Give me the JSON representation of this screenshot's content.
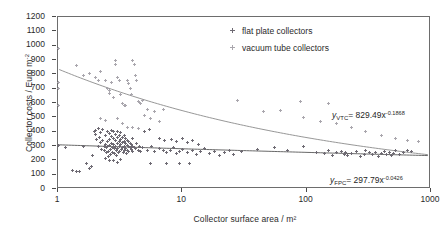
{
  "chart_data": {
    "type": "scatter",
    "title": "",
    "xlabel": "Collector surface area / m²",
    "ylabel": "Collector costs / Euro m",
    "ylabel_sup": "-2",
    "xscale": "log",
    "yscale": "linear",
    "xlim": [
      1,
      1000
    ],
    "ylim": [
      0,
      1200
    ],
    "xticks": [
      1,
      10,
      100,
      1000
    ],
    "xtick_labels": [
      "1",
      "10",
      "100",
      "1000"
    ],
    "yticks": [
      0,
      100,
      200,
      300,
      400,
      500,
      600,
      700,
      800,
      900,
      1000,
      1100,
      1200
    ],
    "ytick_labels": [
      "0",
      "100",
      "200",
      "300",
      "400",
      "500",
      "600",
      "700",
      "800",
      "900",
      "1000",
      "1100",
      "1200"
    ],
    "grid": false,
    "legend_position": "top-right",
    "colors": {
      "flat_plate": "#6e6a73",
      "vacuum_tube": "#a9a6ad",
      "trend_line": "#8a8a8a",
      "axis": "#6d6d6d",
      "text": "#2a2a2a"
    },
    "series": [
      {
        "name": "flat plate collectors",
        "marker": "plus",
        "color": "#6e6a73",
        "points": [
          [
            1.0,
            302
          ],
          [
            1.15,
            288
          ],
          [
            1.3,
            132
          ],
          [
            1.4,
            120
          ],
          [
            1.5,
            125
          ],
          [
            1.6,
            300
          ],
          [
            1.7,
            175
          ],
          [
            1.8,
            143
          ],
          [
            1.85,
            160
          ],
          [
            1.9,
            232
          ],
          [
            1.95,
            398
          ],
          [
            2.0,
            410
          ],
          [
            2.0,
            380
          ],
          [
            2.05,
            345
          ],
          [
            2.1,
            420
          ],
          [
            2.1,
            300
          ],
          [
            2.15,
            358
          ],
          [
            2.2,
            392
          ],
          [
            2.2,
            322
          ],
          [
            2.25,
            276
          ],
          [
            2.3,
            418
          ],
          [
            2.3,
            340
          ],
          [
            2.35,
            300
          ],
          [
            2.35,
            268
          ],
          [
            2.4,
            372
          ],
          [
            2.4,
            312
          ],
          [
            2.45,
            288
          ],
          [
            2.45,
            255
          ],
          [
            2.5,
            400
          ],
          [
            2.5,
            330
          ],
          [
            2.5,
            298
          ],
          [
            2.55,
            262
          ],
          [
            2.55,
            228
          ],
          [
            2.6,
            386
          ],
          [
            2.6,
            348
          ],
          [
            2.6,
            305
          ],
          [
            2.65,
            275
          ],
          [
            2.65,
            243
          ],
          [
            2.7,
            410
          ],
          [
            2.7,
            365
          ],
          [
            2.7,
            318
          ],
          [
            2.75,
            292
          ],
          [
            2.75,
            258
          ],
          [
            2.8,
            398
          ],
          [
            2.8,
            352
          ],
          [
            2.8,
            310
          ],
          [
            2.85,
            280
          ],
          [
            2.85,
            248
          ],
          [
            2.9,
            380
          ],
          [
            2.9,
            335
          ],
          [
            2.9,
            300
          ],
          [
            2.95,
            270
          ],
          [
            2.95,
            236
          ],
          [
            3.0,
            402
          ],
          [
            3.0,
            356
          ],
          [
            3.0,
            315
          ],
          [
            3.0,
            285
          ],
          [
            3.05,
            252
          ],
          [
            3.1,
            372
          ],
          [
            3.1,
            328
          ],
          [
            3.1,
            296
          ],
          [
            3.15,
            264
          ],
          [
            3.2,
            392
          ],
          [
            3.2,
            344
          ],
          [
            3.2,
            308
          ],
          [
            3.25,
            276
          ],
          [
            3.3,
            360
          ],
          [
            3.3,
            322
          ],
          [
            3.3,
            290
          ],
          [
            3.35,
            258
          ],
          [
            3.4,
            376
          ],
          [
            3.4,
            334
          ],
          [
            3.4,
            300
          ],
          [
            3.45,
            268
          ],
          [
            3.5,
            352
          ],
          [
            3.5,
            314
          ],
          [
            3.5,
            282
          ],
          [
            3.55,
            245
          ],
          [
            3.6,
            340
          ],
          [
            3.6,
            305
          ],
          [
            3.6,
            272
          ],
          [
            3.7,
            330
          ],
          [
            3.7,
            296
          ],
          [
            3.7,
            262
          ],
          [
            3.8,
            318
          ],
          [
            3.8,
            288
          ],
          [
            3.9,
            308
          ],
          [
            3.9,
            275
          ],
          [
            4.0,
            352
          ],
          [
            4.0,
            300
          ],
          [
            4.0,
            265
          ],
          [
            4.1,
            292
          ],
          [
            4.2,
            285
          ],
          [
            4.3,
            318
          ],
          [
            4.4,
            272
          ],
          [
            4.5,
            300
          ],
          [
            4.6,
            262
          ],
          [
            4.8,
            288
          ],
          [
            2.6,
            196
          ],
          [
            2.8,
            200
          ],
          [
            3.0,
            188
          ],
          [
            3.2,
            205
          ],
          [
            2.4,
            212
          ],
          [
            5.2,
            268
          ],
          [
            5.6,
            296
          ],
          [
            6.0,
            260
          ],
          [
            6.5,
            282
          ],
          [
            7.0,
            272
          ],
          [
            7.5,
            255
          ],
          [
            8.0,
            266
          ],
          [
            8.5,
            290
          ],
          [
            9.0,
            246
          ],
          [
            9.5,
            262
          ],
          [
            10.0,
            278
          ],
          [
            11.0,
            252
          ],
          [
            12.0,
            268
          ],
          [
            13.0,
            240
          ],
          [
            14.0,
            260
          ],
          [
            15.0,
            284
          ],
          [
            16.5,
            248
          ],
          [
            18.0,
            262
          ],
          [
            20.0,
            236
          ],
          [
            22.0,
            256
          ],
          [
            24.0,
            272
          ],
          [
            26.0,
            244
          ],
          [
            5.5,
            175
          ],
          [
            7.5,
            178
          ],
          [
            9.5,
            176
          ],
          [
            11.5,
            175
          ],
          [
            6.5,
            355
          ],
          [
            7.2,
            340
          ],
          [
            8.2,
            348
          ],
          [
            9.0,
            330
          ],
          [
            10.0,
            350
          ],
          [
            11.0,
            322
          ],
          [
            12.0,
            338
          ],
          [
            13.5,
            312
          ],
          [
            5.0,
            400
          ],
          [
            5.4,
            418
          ],
          [
            30.0,
            262
          ],
          [
            40.0,
            275
          ],
          [
            55.0,
            288
          ],
          [
            70.0,
            268
          ],
          [
            95.0,
            300
          ],
          [
            120.0,
            252
          ],
          [
            140.0,
            248
          ],
          [
            150.0,
            272
          ],
          [
            160.0,
            236
          ],
          [
            175.0,
            255
          ],
          [
            190.0,
            262
          ],
          [
            200.0,
            240
          ],
          [
            205.0,
            258
          ],
          [
            215.0,
            232
          ],
          [
            230.0,
            248
          ],
          [
            250.0,
            262
          ],
          [
            270.0,
            225
          ],
          [
            290.0,
            244
          ],
          [
            300.0,
            270
          ],
          [
            320.0,
            252
          ],
          [
            340.0,
            238
          ],
          [
            360.0,
            256
          ],
          [
            380.0,
            230
          ],
          [
            400.0,
            248
          ],
          [
            420.0,
            262
          ],
          [
            440.0,
            240
          ],
          [
            460.0,
            255
          ],
          [
            480.0,
            232
          ],
          [
            500.0,
            248
          ],
          [
            520.0,
            266
          ],
          [
            560.0,
            242
          ],
          [
            600.0,
            258
          ],
          [
            650.0,
            270
          ],
          [
            700.0,
            262
          ]
        ]
      },
      {
        "name": "vacuum tube collectors",
        "marker": "plus",
        "color": "#a9a6ad",
        "points": [
          [
            1.0,
            980
          ],
          [
            1.0,
            745
          ],
          [
            1.0,
            700
          ],
          [
            1.0,
            585
          ],
          [
            1.4,
            860
          ],
          [
            1.6,
            795
          ],
          [
            1.8,
            805
          ],
          [
            2.0,
            780
          ],
          [
            2.1,
            760
          ],
          [
            2.2,
            820
          ],
          [
            2.4,
            755
          ],
          [
            2.5,
            700
          ],
          [
            2.6,
            690
          ],
          [
            2.6,
            665
          ],
          [
            2.7,
            745
          ],
          [
            2.8,
            640
          ],
          [
            2.9,
            900
          ],
          [
            2.9,
            870
          ],
          [
            3.0,
            775
          ],
          [
            3.1,
            755
          ],
          [
            3.2,
            660
          ],
          [
            3.3,
            600
          ],
          [
            3.4,
            585
          ],
          [
            3.5,
            580
          ],
          [
            3.6,
            760
          ],
          [
            3.7,
            735
          ],
          [
            3.8,
            700
          ],
          [
            3.9,
            660
          ],
          [
            4.0,
            895
          ],
          [
            4.1,
            870
          ],
          [
            4.2,
            790
          ],
          [
            4.3,
            760
          ],
          [
            4.4,
            610
          ],
          [
            4.5,
            605
          ],
          [
            4.6,
            600
          ],
          [
            4.8,
            620
          ],
          [
            5.0,
            510
          ],
          [
            5.2,
            555
          ],
          [
            5.5,
            490
          ],
          [
            6.0,
            540
          ],
          [
            6.5,
            470
          ],
          [
            7.0,
            555
          ],
          [
            3.0,
            490
          ],
          [
            3.3,
            460
          ],
          [
            3.6,
            430
          ],
          [
            4.0,
            430
          ],
          [
            4.4,
            420
          ],
          [
            2.2,
            495
          ],
          [
            2.4,
            480
          ],
          [
            28.0,
            620
          ],
          [
            45.0,
            540
          ],
          [
            62.0,
            545
          ],
          [
            95.0,
            500
          ],
          [
            130.0,
            470
          ],
          [
            175.0,
            455
          ],
          [
            230.0,
            430
          ],
          [
            300.0,
            400
          ],
          [
            400.0,
            375
          ],
          [
            520.0,
            355
          ],
          [
            650.0,
            340
          ],
          [
            800.0,
            330
          ],
          [
            150.0,
            600
          ],
          [
            90.0,
            610
          ]
        ]
      }
    ],
    "trendlines": [
      {
        "name": "vacuum tube collectors fit",
        "label_var": "y",
        "label_sub": "VTC",
        "coefficient": 829.49,
        "exponent": -0.1868,
        "equation_text": "= 829.49x",
        "color": "#8a8a8a"
      },
      {
        "name": "flat plate collectors fit",
        "label_var": "y",
        "label_sub": "FPC",
        "coefficient": 297.79,
        "exponent": -0.0426,
        "equation_text": "= 297.79x",
        "color": "#555555"
      }
    ],
    "legend": [
      {
        "label": "flat plate collectors",
        "marker_class": "fpc"
      },
      {
        "label": "vacuum tube collectors",
        "marker_class": "vtc"
      }
    ]
  }
}
